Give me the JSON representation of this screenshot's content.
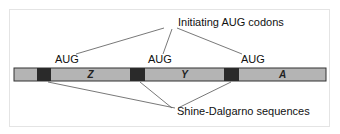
{
  "diagram": {
    "top_label": "Initiating AUG codons",
    "bottom_label": "Shine-Dalgarno sequences",
    "codons": [
      {
        "label": "AUG"
      },
      {
        "label": "AUG"
      },
      {
        "label": "AUG"
      }
    ],
    "genes": [
      {
        "label": "Z"
      },
      {
        "label": "Y"
      },
      {
        "label": "A"
      }
    ],
    "colors": {
      "bar_fill": "#b4b4b4",
      "sd_fill": "#2a2a2a",
      "line": "#444444"
    }
  }
}
